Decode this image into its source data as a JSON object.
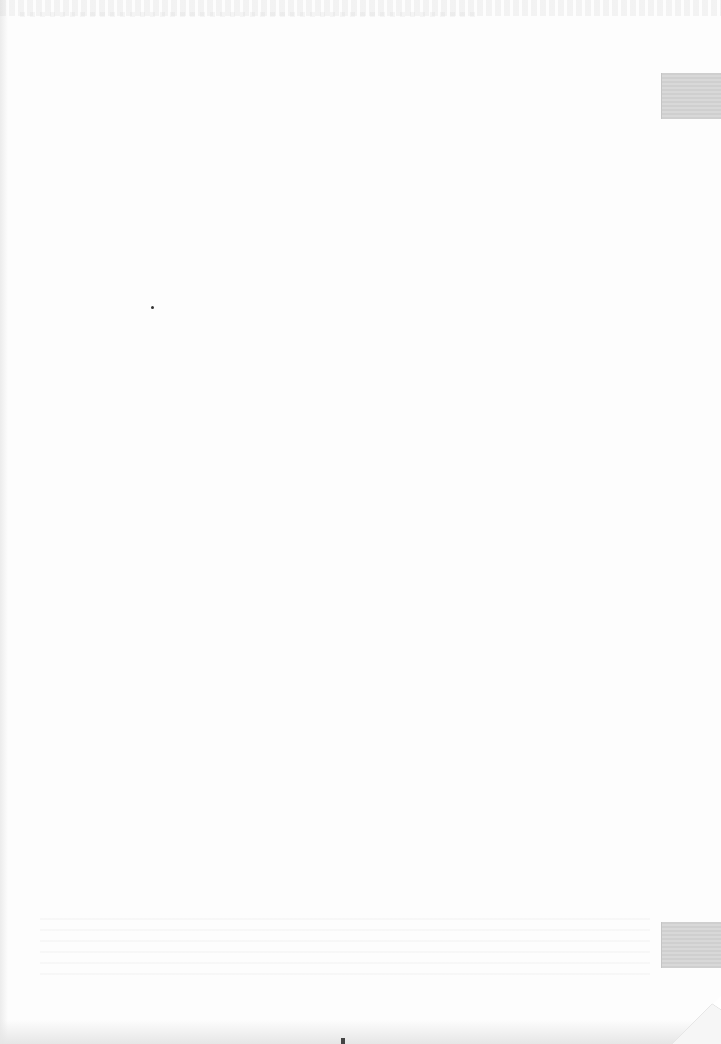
{
  "document": {
    "type": "scanned-page",
    "visible_text": "",
    "colors": {
      "paper": "#fdfdfd",
      "index_tab": "#d2d2d2",
      "speck": "#333333"
    },
    "index_tabs": [
      {
        "position": "right-edge-top"
      },
      {
        "position": "right-edge-bottom"
      }
    ],
    "features": [
      "folded-corner-bottom-right",
      "bleed-through-top",
      "bleed-through-bottom"
    ]
  }
}
